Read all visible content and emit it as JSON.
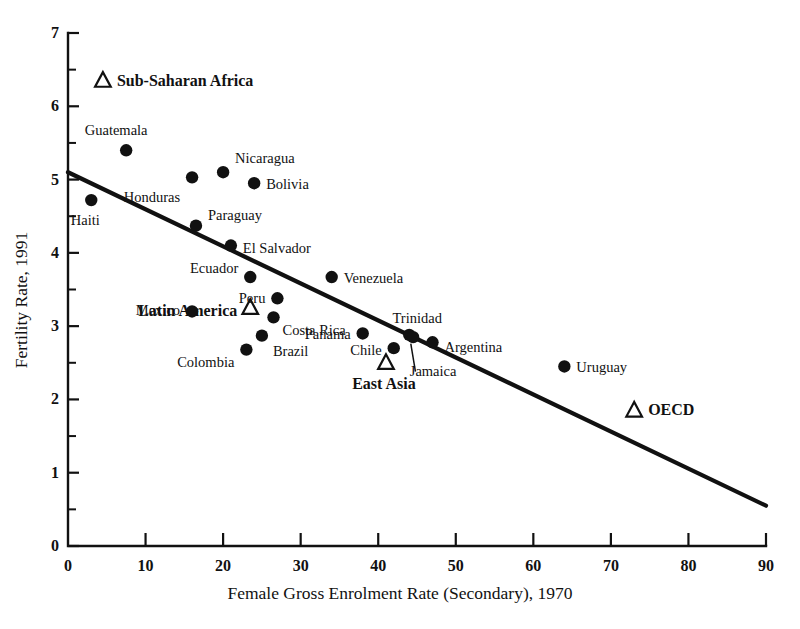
{
  "chart_data": {
    "type": "scatter",
    "title": "",
    "xlabel": "Female Gross Enrolment Rate (Secondary), 1970",
    "ylabel": "Fertility Rate, 1991",
    "xlim": [
      0,
      90
    ],
    "ylim": [
      0,
      7
    ],
    "xticks": [
      0,
      10,
      20,
      30,
      40,
      50,
      60,
      70,
      80,
      90
    ],
    "yticks": [
      0,
      1,
      2,
      3,
      4,
      5,
      6,
      7
    ],
    "y_minor_ticks": [
      0.5,
      1.5,
      2.5,
      3.5,
      4.5,
      5.5,
      6.5
    ],
    "grid": false,
    "legend": "none",
    "marker_color": "#111111",
    "line_color": "#111111",
    "points": [
      {
        "label": "Haiti",
        "x": 3.0,
        "y": 4.72,
        "marker": "circle",
        "label_dx": -6,
        "label_dy": 20,
        "anchor": "center",
        "bold": false
      },
      {
        "label": "Guatemala",
        "x": 7.5,
        "y": 5.4,
        "marker": "circle",
        "label_dx": -10,
        "label_dy": -20,
        "anchor": "center",
        "bold": false
      },
      {
        "label": "Honduras",
        "x": 16.0,
        "y": 5.03,
        "marker": "circle",
        "label_dx": -12,
        "label_dy": 20,
        "anchor": "right",
        "bold": false
      },
      {
        "label": "Nicaragua",
        "x": 20.0,
        "y": 5.1,
        "marker": "circle",
        "label_dx": 12,
        "label_dy": -14,
        "anchor": "left",
        "bold": false
      },
      {
        "label": "Bolivia",
        "x": 24.0,
        "y": 4.95,
        "marker": "circle",
        "label_dx": 12,
        "label_dy": 1,
        "anchor": "left",
        "bold": false
      },
      {
        "label": "Paraguay",
        "x": 16.5,
        "y": 4.37,
        "marker": "circle",
        "label_dx": 12,
        "label_dy": -11,
        "anchor": "left",
        "bold": false
      },
      {
        "label": "El Salvador",
        "x": 21.0,
        "y": 4.1,
        "marker": "circle",
        "label_dx": 12,
        "label_dy": 2,
        "anchor": "left",
        "bold": false
      },
      {
        "label": "Ecuador",
        "x": 23.5,
        "y": 3.67,
        "marker": "circle",
        "label_dx": -12,
        "label_dy": -9,
        "anchor": "right",
        "bold": false
      },
      {
        "label": "Venezuela",
        "x": 34.0,
        "y": 3.67,
        "marker": "circle",
        "label_dx": 12,
        "label_dy": 1,
        "anchor": "left",
        "bold": false
      },
      {
        "label": "Peru",
        "x": 27.0,
        "y": 3.38,
        "marker": "circle",
        "label_dx": -12,
        "label_dy": 0,
        "anchor": "right",
        "bold": false
      },
      {
        "label": "Mexico",
        "x": 16.0,
        "y": 3.2,
        "marker": "circle",
        "label_dx": -12,
        "label_dy": -1,
        "anchor": "right",
        "bold": false
      },
      {
        "label": "Costa Rica",
        "x": 26.5,
        "y": 3.12,
        "marker": "circle",
        "label_dx": 9,
        "label_dy": 13,
        "anchor": "left",
        "bold": false
      },
      {
        "label": "Colombia",
        "x": 23.0,
        "y": 2.68,
        "marker": "circle",
        "label_dx": -12,
        "label_dy": 12,
        "anchor": "right",
        "bold": false
      },
      {
        "label": "Brazil",
        "x": 25.0,
        "y": 2.87,
        "marker": "circle",
        "label_dx": 11,
        "label_dy": 15,
        "anchor": "left",
        "bold": false
      },
      {
        "label": "Panama",
        "x": 38.0,
        "y": 2.9,
        "marker": "circle",
        "label_dx": -12,
        "label_dy": 1,
        "anchor": "right",
        "bold": false
      },
      {
        "label": "Chile",
        "x": 42.0,
        "y": 2.7,
        "marker": "circle",
        "label_dx": -12,
        "label_dy": 2,
        "anchor": "right",
        "bold": false
      },
      {
        "label": "Trinidad",
        "x": 44.0,
        "y": 2.88,
        "marker": "circle",
        "label_dx": 8,
        "label_dy": -17,
        "anchor": "center",
        "bold": false
      },
      {
        "label": "Jamaica",
        "x": 44.5,
        "y": 2.85,
        "marker": "circle",
        "label_dx": 20,
        "label_dy": 34,
        "anchor": "center",
        "bold": false
      },
      {
        "label": "Argentina",
        "x": 47.0,
        "y": 2.78,
        "marker": "circle",
        "label_dx": 12,
        "label_dy": 5,
        "anchor": "left",
        "bold": false
      },
      {
        "label": "Uruguay",
        "x": 64.0,
        "y": 2.45,
        "marker": "circle",
        "label_dx": 12,
        "label_dy": 1,
        "anchor": "left",
        "bold": false
      },
      {
        "label": "Sub-Saharan Africa",
        "x": 4.5,
        "y": 6.35,
        "marker": "triangle",
        "label_dx": 14,
        "label_dy": 0,
        "anchor": "left",
        "bold": true
      },
      {
        "label": "Latin America",
        "x": 23.5,
        "y": 3.25,
        "marker": "triangle",
        "label_dx": -13,
        "label_dy": 3,
        "anchor": "right",
        "bold": true
      },
      {
        "label": "East Asia",
        "x": 41.0,
        "y": 2.5,
        "marker": "triangle",
        "label_dx": -2,
        "label_dy": 21,
        "anchor": "center",
        "bold": true
      },
      {
        "label": "OECD",
        "x": 73.0,
        "y": 1.85,
        "marker": "triangle",
        "label_dx": 14,
        "label_dy": 0,
        "anchor": "left",
        "bold": true
      }
    ],
    "trend_line": {
      "x_start": 0,
      "y_start": 5.1,
      "x_end": 90,
      "y_end": 0.55
    },
    "leader_lines": [
      {
        "x1": 44.8,
        "y1": 2.38,
        "x2": 44.2,
        "y2": 2.76
      }
    ]
  }
}
